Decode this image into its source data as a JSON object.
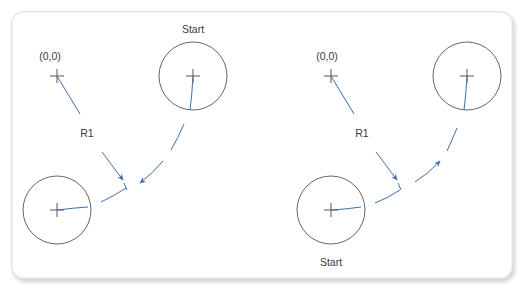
{
  "figure": {
    "caption_cropped": true
  },
  "colors": {
    "path_blue": "#3a6fb5",
    "circle_stroke": "#555555",
    "label_text": "#3a3a3a",
    "panel_border": "#dcdcdc"
  },
  "left_diagram": {
    "origin_label": "(0,0)",
    "radius_label": "R1",
    "start_label": "Start",
    "start_position": "top-right circle",
    "direction": "clockwise toward bottom-left circle"
  },
  "right_diagram": {
    "origin_label": "(0,0)",
    "radius_label": "R1",
    "start_label": "Start",
    "start_position": "bottom-left circle",
    "direction": "counter-clockwise toward top-right circle"
  }
}
